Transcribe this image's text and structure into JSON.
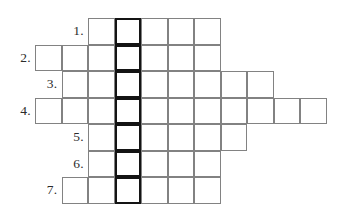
{
  "puzzle": {
    "type": "crossword-word-ladder",
    "title": "",
    "cell_size": 26.5,
    "origin_x": 35,
    "origin_y": 18,
    "highlight_column_index": 3,
    "colors": {
      "background": "#ffffff",
      "cell_fill": "#ffffff",
      "grid_line": "#828282",
      "key_column_border": "#141414",
      "number_text": "#2b2b2b"
    },
    "rows": [
      {
        "number_label": "1.",
        "row_index": 0,
        "start_column": 2,
        "cell_count": 5,
        "columns": [
          2,
          3,
          4,
          5,
          6
        ],
        "letters": [
          "",
          "",
          "",
          "",
          ""
        ]
      },
      {
        "number_label": "2.",
        "row_index": 1,
        "start_column": 0,
        "cell_count": 7,
        "columns": [
          0,
          1,
          2,
          3,
          4,
          5,
          6
        ],
        "letters": [
          "",
          "",
          "",
          "",
          "",
          "",
          ""
        ]
      },
      {
        "number_label": "3.",
        "row_index": 2,
        "start_column": 1,
        "cell_count": 8,
        "columns": [
          1,
          2,
          3,
          4,
          5,
          6,
          7,
          8
        ],
        "letters": [
          "",
          "",
          "",
          "",
          "",
          "",
          "",
          ""
        ]
      },
      {
        "number_label": "4.",
        "row_index": 3,
        "start_column": 0,
        "cell_count": 11,
        "columns": [
          0,
          1,
          2,
          3,
          4,
          5,
          6,
          7,
          8,
          9,
          10
        ],
        "letters": [
          "",
          "",
          "",
          "",
          "",
          "",
          "",
          "",
          "",
          "",
          ""
        ]
      },
      {
        "number_label": "5.",
        "row_index": 4,
        "start_column": 2,
        "cell_count": 6,
        "columns": [
          2,
          3,
          4,
          5,
          6,
          7
        ],
        "letters": [
          "",
          "",
          "",
          "",
          "",
          ""
        ]
      },
      {
        "number_label": "6.",
        "row_index": 5,
        "start_column": 2,
        "cell_count": 5,
        "columns": [
          2,
          3,
          4,
          5,
          6
        ],
        "letters": [
          "",
          "",
          "",
          "",
          ""
        ]
      },
      {
        "number_label": "7.",
        "row_index": 6,
        "start_column": 1,
        "cell_count": 6,
        "columns": [
          1,
          2,
          3,
          4,
          5,
          6
        ],
        "letters": [
          "",
          "",
          "",
          "",
          "",
          ""
        ]
      }
    ]
  }
}
